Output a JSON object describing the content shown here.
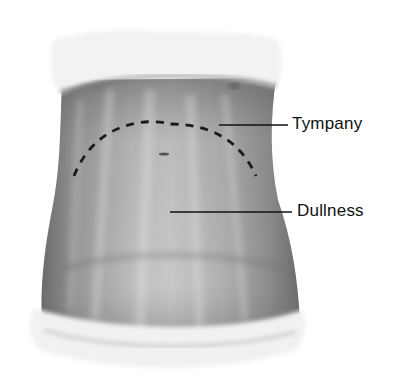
{
  "figure": {
    "labels": [
      {
        "id": "tympany",
        "text": "Tympany"
      },
      {
        "id": "dullness",
        "text": "Dullness"
      }
    ],
    "colors": {
      "background": "#ffffff",
      "skin_dark": "#6e6e6e",
      "skin_light": "#c9c9c9",
      "cloth": "#efefef",
      "ink": "#111111"
    }
  }
}
